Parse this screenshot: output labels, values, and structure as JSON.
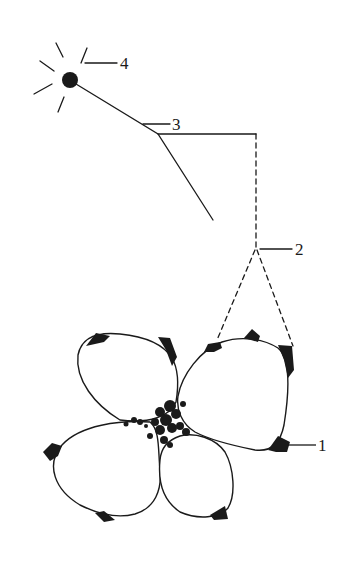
{
  "diagram": {
    "labels": [
      {
        "id": "1",
        "text": "1",
        "target": "dark spot at petal tip"
      },
      {
        "id": "2",
        "text": "2",
        "target": "apex of dashed projection lines"
      },
      {
        "id": "3",
        "text": "3",
        "target": "bend of the stick"
      },
      {
        "id": "4",
        "text": "4",
        "target": "sun / light source"
      }
    ],
    "colors": {
      "stroke": "#1a1a1a",
      "background": "#ffffff"
    }
  }
}
